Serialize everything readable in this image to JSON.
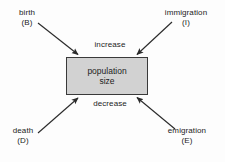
{
  "diagram": {
    "background_color": "#fdfdfd",
    "box": {
      "label_line1": "population",
      "label_line2": "size",
      "fill_color": "#d2d2d2",
      "border_color": "#3a3a3a"
    },
    "flow_labels": {
      "increase": "increase",
      "decrease": "decrease"
    },
    "inputs": [
      {
        "name": "birth",
        "label_line1": "birth",
        "label_line2": "(B)",
        "symbol": "B",
        "position": "top-left",
        "effect": "increase"
      },
      {
        "name": "immigration",
        "label_line1": "immigration",
        "label_line2": "(I)",
        "symbol": "I",
        "position": "top-right",
        "effect": "increase"
      },
      {
        "name": "death",
        "label_line1": "death",
        "label_line2": "(D)",
        "symbol": "D",
        "position": "bottom-left",
        "effect": "decrease"
      },
      {
        "name": "emigration",
        "label_line1": "emigration",
        "label_line2": "(E)",
        "symbol": "E",
        "position": "bottom-right",
        "effect": "decrease"
      }
    ],
    "arrows": [
      {
        "name": "birth-arrow",
        "from": [
          38,
          23
        ],
        "to": [
          79,
          55
        ],
        "color": "#2b2b2b"
      },
      {
        "name": "immigration-arrow",
        "from": [
          172,
          22
        ],
        "to": [
          136,
          55
        ],
        "color": "#2b2b2b"
      },
      {
        "name": "death-arrow",
        "from": [
          38,
          133
        ],
        "to": [
          79,
          98
        ],
        "color": "#2b2b2b"
      },
      {
        "name": "emigration-arrow",
        "from": [
          175,
          129
        ],
        "to": [
          136,
          97
        ],
        "color": "#2b2b2b"
      }
    ]
  }
}
